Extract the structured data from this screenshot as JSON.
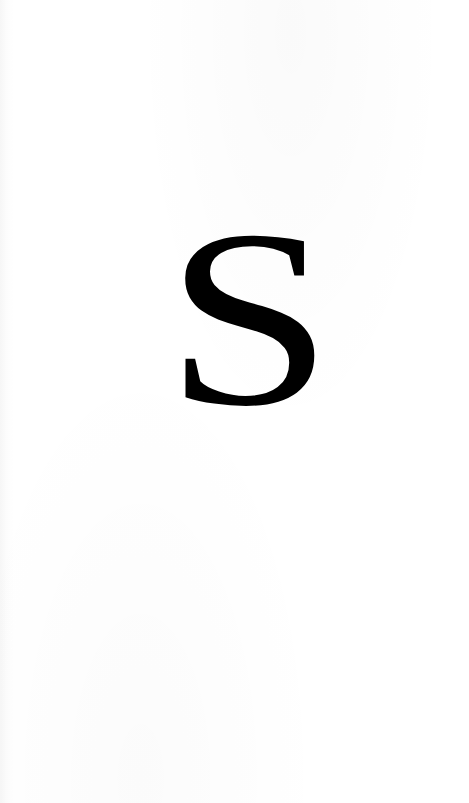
{
  "page": {
    "width": 469,
    "height": 803,
    "background_color": "#ffffff",
    "media": "scanned-book-page",
    "content_description": "blank page bearing a single large serif capital letter"
  },
  "dropcap": {
    "character": "S",
    "color": "#000000",
    "typeface_style": "serif",
    "case": "uppercase",
    "glyph_box": {
      "x": 165,
      "y": 178,
      "width": 168,
      "height": 280
    }
  },
  "artifacts": {
    "left_edge_shadow_label": "scan-edge-shadow",
    "paper_noise_label": "scan-noise"
  }
}
